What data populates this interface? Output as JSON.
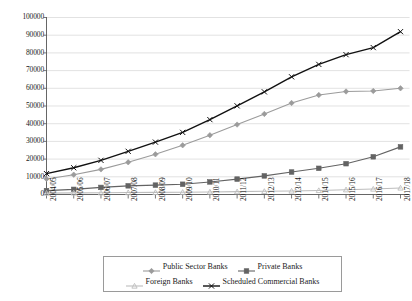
{
  "chart_data": {
    "type": "line",
    "title": "",
    "subtitle": "",
    "xlabel": "",
    "ylabel": "",
    "grid": "horizontal",
    "legend_position": "bottom",
    "xlim_categories": 14,
    "ylim": [
      0,
      100000
    ],
    "ytick_step": 10000,
    "yticks": [
      "0",
      "10000",
      "20000",
      "30000",
      "40000",
      "50000",
      "60000",
      "70000",
      "80000",
      "90000",
      "100000"
    ],
    "categories": [
      "2004/05",
      "2005/06",
      "2006/07",
      "2007/08",
      "2008/09",
      "2009/10",
      "2010/11",
      "2011/12",
      "2012/13",
      "2013/14",
      "2014/15",
      "2015/16",
      "2016/17",
      "2017/18"
    ],
    "series": [
      {
        "name": "Public Sector Banks",
        "color": "#9b9b9b",
        "marker": "diamond",
        "values": [
          8800,
          11200,
          14200,
          18200,
          22700,
          27800,
          33500,
          39500,
          45500,
          51700,
          56200,
          58200,
          58500,
          60000
        ]
      },
      {
        "name": "Private Banks",
        "color": "#636363",
        "marker": "square",
        "values": [
          2200,
          2900,
          4000,
          4900,
          5300,
          5800,
          7100,
          8700,
          10500,
          12700,
          14800,
          17400,
          21300,
          26900
        ]
      },
      {
        "name": "Foreign Banks",
        "color": "#bdbdbd",
        "marker": "triangle",
        "values": [
          800,
          900,
          1000,
          1100,
          1200,
          1300,
          1450,
          1600,
          1800,
          2000,
          2300,
          2700,
          3100,
          3700
        ]
      },
      {
        "name": "Scheduled Commercial Banks",
        "color": "#111111",
        "marker": "cross",
        "values": [
          11800,
          15100,
          19300,
          24400,
          29600,
          35100,
          42300,
          50100,
          58000,
          66500,
          73500,
          79000,
          83000,
          92000
        ]
      }
    ]
  },
  "legend": {
    "entries": [
      {
        "label": "Public Sector Banks"
      },
      {
        "label": "Private Banks"
      },
      {
        "label": "Foreign Banks"
      },
      {
        "label": "Scheduled Commercial Banks"
      }
    ]
  }
}
